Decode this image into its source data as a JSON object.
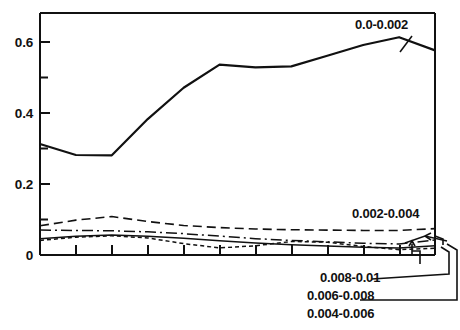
{
  "chart_data": {
    "type": "line",
    "title": "",
    "subtitle": "",
    "xlabel": "",
    "ylabel": "",
    "xlim": [
      0,
      11
    ],
    "ylim": [
      0,
      0.68
    ],
    "grid": false,
    "legend_position": "inline-annotations",
    "y_ticks_major": [
      0,
      0.2,
      0.4,
      0.6
    ],
    "y_tick_labels": [
      "0",
      "0.2",
      "0.4",
      "0.6"
    ],
    "y_ticks_minor": [
      0.1,
      0.3,
      0.5
    ],
    "x_ticks": [
      0,
      1,
      2,
      3,
      4,
      5,
      6,
      7,
      8,
      9,
      10,
      11
    ],
    "x_tick_labels": [],
    "x": [
      0,
      1,
      2,
      3,
      4,
      5,
      6,
      7,
      8,
      9,
      10,
      11
    ],
    "series": [
      {
        "name": "0.0-0.002",
        "style": "solid",
        "values": [
          0.312,
          0.281,
          0.28,
          0.382,
          0.47,
          0.535,
          0.527,
          0.53,
          0.56,
          0.59,
          0.612,
          0.575
        ]
      },
      {
        "name": "0.002-0.004",
        "style": "long-dashed",
        "values": [
          0.082,
          0.098,
          0.108,
          0.094,
          0.083,
          0.077,
          0.073,
          0.071,
          0.07,
          0.069,
          0.069,
          0.074
        ]
      },
      {
        "name": "0.004-0.006",
        "style": "dash-dot",
        "values": [
          0.07,
          0.069,
          0.068,
          0.065,
          0.06,
          0.053,
          0.046,
          0.041,
          0.037,
          0.033,
          0.031,
          0.042
        ]
      },
      {
        "name": "0.006-0.008",
        "style": "solid-thin",
        "values": [
          0.046,
          0.053,
          0.056,
          0.053,
          0.047,
          0.04,
          0.034,
          0.029,
          0.025,
          0.022,
          0.02,
          0.026
        ]
      },
      {
        "name": "0.008-0.01",
        "style": "short-dashed",
        "values": [
          0.041,
          0.05,
          0.054,
          0.048,
          0.032,
          0.02,
          0.026,
          0.038,
          0.036,
          0.024,
          0.015,
          0.019
        ]
      }
    ],
    "annotations": [
      {
        "text": "0.0-0.002",
        "target_series": "0.0-0.002"
      },
      {
        "text": "0.002-0.004",
        "target_series": "0.002-0.004"
      },
      {
        "text": "0.008-0.01",
        "target_series": "0.008-0.01"
      },
      {
        "text": "0.006-0.008",
        "target_series": "0.006-0.008"
      },
      {
        "text": "0.004-0.006",
        "target_series": "0.004-0.006"
      }
    ],
    "colors": {
      "line": "#111111",
      "axis": "#111111",
      "background": "#ffffff"
    }
  },
  "axis": {
    "y_labels": {
      "t0": "0",
      "t1": "0.2",
      "t2": "0.4",
      "t3": "0.6"
    }
  },
  "labels": {
    "main": "0.0-0.002",
    "band2": "0.002-0.004",
    "band5": "0.008-0.01",
    "band4": "0.006-0.008",
    "band3": "0.004-0.006"
  }
}
